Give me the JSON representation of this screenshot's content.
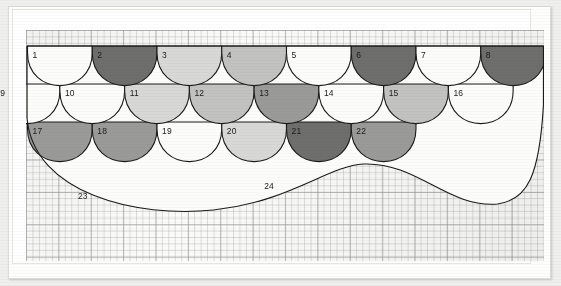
{
  "figure": {
    "type": "pattern-diagram",
    "medium": "graph paper drawing"
  },
  "palette": {
    "white": "#fcfcfa",
    "light": "#d8d8d6",
    "light_medium": "#c2c2c0",
    "medium": "#9a9a98",
    "dark": "#6e6e6c",
    "outline": "#1a1a1a",
    "paper": "#fbfbf9",
    "grid_line": "#9a9a9a",
    "mount": "#ffffff"
  },
  "layout": {
    "columns": 8,
    "rows": 3,
    "scale_width": 64.75,
    "row_height": 38,
    "grid_left": 26,
    "grid_top": 30,
    "grid_width": 518,
    "grid_height": 231,
    "pattern_top": 46,
    "offset_rows": [
      0,
      1,
      0
    ]
  },
  "scales": [
    {
      "number": "1",
      "row": 1,
      "col": 1,
      "shade": "white"
    },
    {
      "number": "2",
      "row": 1,
      "col": 2,
      "shade": "dark"
    },
    {
      "number": "3",
      "row": 1,
      "col": 3,
      "shade": "light"
    },
    {
      "number": "4",
      "row": 1,
      "col": 4,
      "shade": "light_medium"
    },
    {
      "number": "5",
      "row": 1,
      "col": 5,
      "shade": "white"
    },
    {
      "number": "6",
      "row": 1,
      "col": 6,
      "shade": "dark"
    },
    {
      "number": "7",
      "row": 1,
      "col": 7,
      "shade": "white"
    },
    {
      "number": "8",
      "row": 1,
      "col": 8,
      "shade": "dark"
    },
    {
      "number": "9",
      "row": 2,
      "col": 1,
      "shade": "white"
    },
    {
      "number": "10",
      "row": 2,
      "col": 2,
      "shade": "white"
    },
    {
      "number": "11",
      "row": 2,
      "col": 3,
      "shade": "light"
    },
    {
      "number": "12",
      "row": 2,
      "col": 4,
      "shade": "light_medium"
    },
    {
      "number": "13",
      "row": 2,
      "col": 5,
      "shade": "medium"
    },
    {
      "number": "14",
      "row": 2,
      "col": 6,
      "shade": "white"
    },
    {
      "number": "15",
      "row": 2,
      "col": 7,
      "shade": "light_medium"
    },
    {
      "number": "16",
      "row": 2,
      "col": 8,
      "shade": "white"
    },
    {
      "number": "17",
      "row": 3,
      "col": 1,
      "shade": "medium"
    },
    {
      "number": "18",
      "row": 3,
      "col": 2,
      "shade": "medium"
    },
    {
      "number": "19",
      "row": 3,
      "col": 3,
      "shade": "white"
    },
    {
      "number": "20",
      "row": 3,
      "col": 4,
      "shade": "light"
    },
    {
      "number": "21",
      "row": 3,
      "col": 5,
      "shade": "dark"
    },
    {
      "number": "22",
      "row": 3,
      "col": 6,
      "shade": "medium"
    },
    {
      "number": "23",
      "row": 4,
      "col": 2,
      "shade": "white"
    },
    {
      "number": "24",
      "row": 4,
      "col": 5,
      "shade": "white"
    }
  ],
  "labels": {
    "numbers": [
      "1",
      "2",
      "3",
      "4",
      "5",
      "6",
      "7",
      "8",
      "9",
      "10",
      "11",
      "12",
      "13",
      "14",
      "15",
      "16",
      "17",
      "18",
      "19",
      "20",
      "21",
      "22",
      "23",
      "24"
    ]
  }
}
